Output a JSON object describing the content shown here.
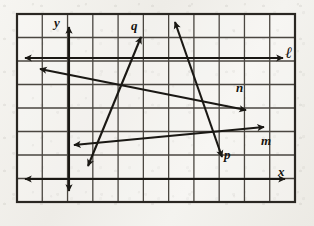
{
  "figure": {
    "kind": "geometry-line-diagram",
    "title_text": "",
    "background": "#f1efea",
    "ink_color": "#1a1814",
    "grid": {
      "left": 17,
      "top": 14,
      "right": 295,
      "bottom": 202,
      "columns": 11,
      "rows": 8,
      "cell_width": 25.3,
      "cell_height": 23.5,
      "border_color": "#2a2722",
      "line_color": "#4a4640",
      "border_width": 2.2,
      "line_width": 1.3
    },
    "axes": [
      {
        "name": "y-axis",
        "label": "y",
        "orientation": "vertical",
        "x": 69,
        "y1": 27,
        "y2": 191,
        "arrow_start": true,
        "arrow_end": true,
        "label_x": 54,
        "label_y": 16
      },
      {
        "name": "x-axis",
        "label": "x",
        "orientation": "horizontal",
        "y": 179,
        "x1": 25,
        "x2": 285,
        "arrow_start": true,
        "arrow_end": true,
        "label_x": 278,
        "label_y": 165
      }
    ],
    "lines": [
      {
        "name": "line-l",
        "label": "ℓ",
        "label_style": "script",
        "x1": 25,
        "y1": 58,
        "x2": 283,
        "y2": 58,
        "arrow_start": true,
        "arrow_end": true,
        "label_x": 285,
        "label_y": 45,
        "note": "horizontal line near top of grid"
      },
      {
        "name": "line-n",
        "label": "n",
        "label_style": "italic",
        "x1": 40,
        "y1": 69,
        "x2": 246,
        "y2": 110,
        "arrow_start": true,
        "arrow_end": true,
        "label_x": 236,
        "label_y": 81,
        "note": "descends left-to-right; arrowhead up-right near n label"
      },
      {
        "name": "line-m",
        "label": "m",
        "label_style": "italic",
        "x1": 74,
        "y1": 145,
        "x2": 264,
        "y2": 127,
        "arrow_start": true,
        "arrow_end": true,
        "label_x": 261,
        "label_y": 134,
        "note": "rises left-to-right then arrowhead points down-right"
      },
      {
        "name": "line-q",
        "label": "q",
        "label_style": "italic",
        "x1": 88,
        "y1": 166,
        "x2": 141,
        "y2": 37,
        "arrow_start": true,
        "arrow_end": true,
        "label_x": 131,
        "label_y": 19,
        "note": "steep line rising to upper right"
      },
      {
        "name": "line-p",
        "label": "p",
        "label_style": "italic",
        "x1": 175,
        "y1": 22,
        "x2": 222,
        "y2": 157,
        "arrow_start": true,
        "arrow_end": true,
        "label_x": 224,
        "label_y": 148,
        "note": "steep line falling to lower right"
      }
    ],
    "labels": [
      {
        "name": "label-y",
        "text": "y"
      },
      {
        "name": "label-x",
        "text": "x"
      },
      {
        "name": "label-l",
        "text": "ℓ"
      },
      {
        "name": "label-n",
        "text": "n"
      },
      {
        "name": "label-m",
        "text": "m"
      },
      {
        "name": "label-q",
        "text": "q"
      },
      {
        "name": "label-p",
        "text": "p"
      }
    ]
  }
}
